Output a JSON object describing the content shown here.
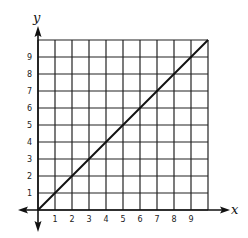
{
  "chart_data": {
    "type": "line",
    "title": "",
    "xlabel": "x",
    "ylabel": "y",
    "x_ticks": [
      "1",
      "2",
      "3",
      "4",
      "5",
      "6",
      "7",
      "8",
      "9"
    ],
    "y_ticks": [
      "1",
      "2",
      "3",
      "4",
      "5",
      "6",
      "7",
      "8",
      "9"
    ],
    "xlim": [
      0,
      10
    ],
    "ylim": [
      0,
      10
    ],
    "grid": true,
    "series": [
      {
        "name": "y = x",
        "x": [
          0,
          10
        ],
        "y": [
          0,
          10
        ]
      }
    ]
  }
}
